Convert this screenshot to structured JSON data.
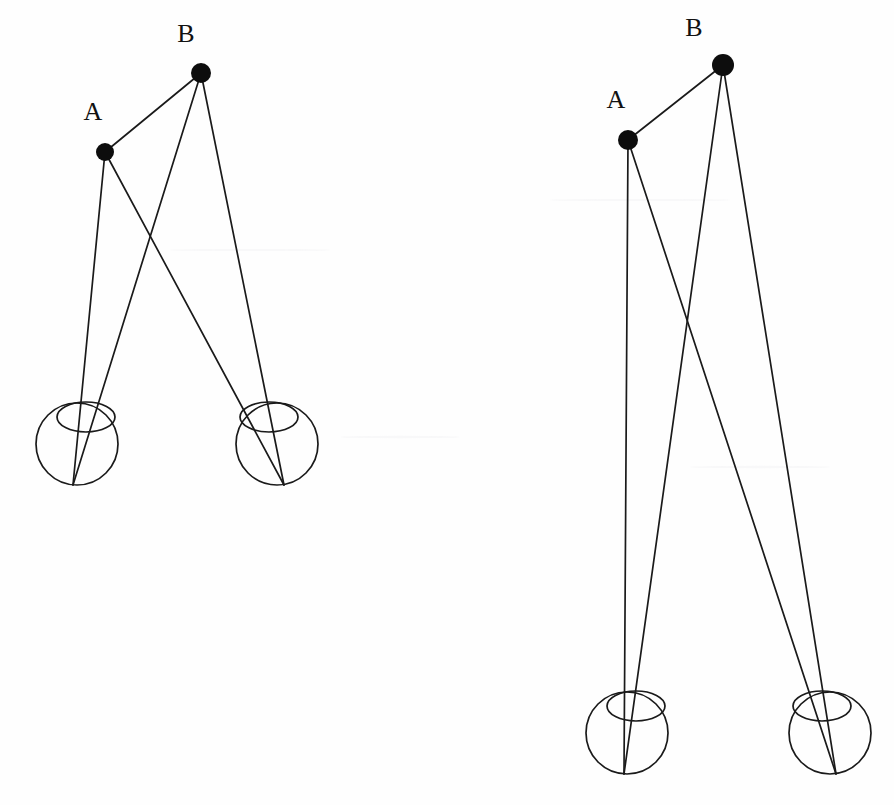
{
  "figure": {
    "background_color": "#fefefe",
    "line_color": "#1a1a1a",
    "dot_color": "#0d0d0d",
    "label_color": "#111111",
    "width": 894,
    "height": 805
  },
  "panels": [
    {
      "id": "left-panel",
      "name": "near-configuration",
      "points": [
        {
          "id": "A",
          "label": "A",
          "label_x": 93,
          "label_y": 120,
          "dot_x": 105,
          "dot_y": 152,
          "dot_r": 9
        },
        {
          "id": "B",
          "label": "B",
          "label_x": 180,
          "label_y": 42,
          "dot_x": 201,
          "dot_y": 73,
          "dot_r": 10
        }
      ],
      "connector": {
        "from": "A",
        "to": "B",
        "x1": 105,
        "y1": 152,
        "x2": 201,
        "y2": 73
      },
      "eyes": [
        {
          "id": "left-eye",
          "cx": 77,
          "cy": 444,
          "r": 41,
          "fovea_x": 73,
          "fovea_y": 485,
          "cornea_cx": 86,
          "cornea_cy": 417,
          "cornea_rx": 29,
          "cornea_ry": 15
        },
        {
          "id": "right-eye",
          "cx": 277,
          "cy": 444,
          "r": 41,
          "fovea_x": 284,
          "fovea_y": 485,
          "cornea_cx": 269,
          "cornea_cy": 417,
          "cornea_rx": 29,
          "cornea_ry": 15
        }
      ],
      "rays": [
        {
          "from": "A",
          "to": "left-eye",
          "x1": 105,
          "y1": 152,
          "x2": 73,
          "y2": 485
        },
        {
          "from": "A",
          "to": "right-eye",
          "x1": 105,
          "y1": 152,
          "x2": 284,
          "y2": 485
        },
        {
          "from": "B",
          "to": "left-eye",
          "x1": 201,
          "y1": 73,
          "x2": 73,
          "y2": 485
        },
        {
          "from": "B",
          "to": "right-eye",
          "x1": 201,
          "y1": 73,
          "x2": 284,
          "y2": 485
        }
      ]
    },
    {
      "id": "right-panel",
      "name": "far-configuration",
      "points": [
        {
          "id": "A",
          "label": "A",
          "label_x": 616,
          "label_y": 108,
          "dot_x": 628,
          "dot_y": 140,
          "dot_r": 10
        },
        {
          "id": "B",
          "label": "B",
          "label_x": 694,
          "label_y": 36,
          "dot_x": 723,
          "dot_y": 65,
          "dot_r": 11
        }
      ],
      "connector": {
        "from": "A",
        "to": "B",
        "x1": 628,
        "y1": 140,
        "x2": 723,
        "y2": 65
      },
      "eyes": [
        {
          "id": "left-eye",
          "cx": 627,
          "cy": 733,
          "r": 41,
          "fovea_x": 624,
          "fovea_y": 774,
          "cornea_cx": 636,
          "cornea_cy": 706,
          "cornea_rx": 29,
          "cornea_ry": 15
        },
        {
          "id": "right-eye",
          "cx": 830,
          "cy": 733,
          "r": 41,
          "fovea_x": 836,
          "fovea_y": 774,
          "cornea_cx": 822,
          "cornea_cy": 706,
          "cornea_rx": 29,
          "cornea_ry": 15
        }
      ],
      "rays": [
        {
          "from": "A",
          "to": "left-eye",
          "x1": 628,
          "y1": 140,
          "x2": 624,
          "y2": 774
        },
        {
          "from": "A",
          "to": "right-eye",
          "x1": 628,
          "y1": 140,
          "x2": 836,
          "y2": 774
        },
        {
          "from": "B",
          "to": "left-eye",
          "x1": 723,
          "y1": 65,
          "x2": 624,
          "y2": 774
        },
        {
          "from": "B",
          "to": "right-eye",
          "x1": 723,
          "y1": 65,
          "x2": 836,
          "y2": 774
        }
      ]
    }
  ]
}
